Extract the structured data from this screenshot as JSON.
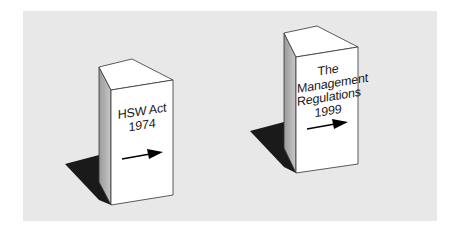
{
  "diagram": {
    "background_color": "#e8e8e8",
    "pillars": [
      {
        "id": "hsw-act",
        "lines": [
          "HSW Act",
          "1974"
        ],
        "arrow": "right-arrow"
      },
      {
        "id": "management-regulations",
        "lines": [
          "The",
          "Management",
          "Regulations",
          "1999"
        ],
        "arrow": "right-arrow"
      }
    ],
    "colors": {
      "face_front": "#ffffff",
      "face_top": "#ffffff",
      "face_side": "#b8b8b8",
      "shadow": "#1a1a1a",
      "outline": "#333333",
      "arrow": "#000000"
    }
  }
}
